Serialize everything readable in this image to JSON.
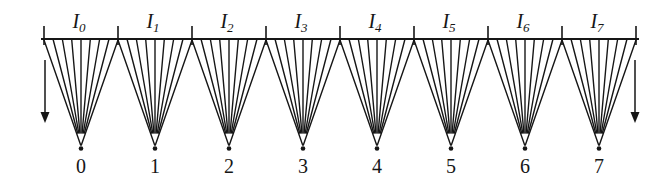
{
  "figure": {
    "colors": {
      "background": "#ffffff",
      "ink": "#161616"
    },
    "structure": {
      "interval_count": 8,
      "tick_count": 9,
      "rays_per_interval": 9,
      "end_arrows": 2,
      "arrow_direction": "down"
    },
    "intervals": [
      {
        "label_base": "I",
        "label_sub": "0",
        "point_label": "0"
      },
      {
        "label_base": "I",
        "label_sub": "1",
        "point_label": "1"
      },
      {
        "label_base": "I",
        "label_sub": "2",
        "point_label": "2"
      },
      {
        "label_base": "I",
        "label_sub": "3",
        "point_label": "3"
      },
      {
        "label_base": "I",
        "label_sub": "4",
        "point_label": "4"
      },
      {
        "label_base": "I",
        "label_sub": "5",
        "point_label": "5"
      },
      {
        "label_base": "I",
        "label_sub": "6",
        "point_label": "6"
      },
      {
        "label_base": "I",
        "label_sub": "7",
        "point_label": "7"
      }
    ]
  }
}
